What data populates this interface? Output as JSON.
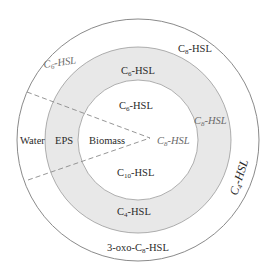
{
  "diagram": {
    "type": "concentric-layers",
    "colors": {
      "background": "#ffffff",
      "outer_ring_fill": "#ffffff",
      "eps_ring_fill": "#e8e8e8",
      "inner_fill": "#ffffff",
      "stroke": "#8a8a8a",
      "dashed": "#8a8a8a"
    },
    "regions": {
      "water": "Water",
      "eps": "EPS",
      "biomass": "Biomass"
    },
    "labels": {
      "outer_top_left": {
        "base": "C",
        "sub": "6",
        "tail": "-HSL"
      },
      "outer_top_right": {
        "base": "C",
        "sub": "8",
        "tail": "-HSL"
      },
      "outer_right": {
        "base": "C",
        "sub": "4",
        "tail": "-HSL"
      },
      "outer_bottom": {
        "pre": "3-oxo-C",
        "sub": "8",
        "tail": "-HSL"
      },
      "eps_top": {
        "base": "C",
        "sub": "6",
        "tail": "-HSL"
      },
      "eps_right": {
        "base": "C",
        "sub": "8",
        "tail": "-HSL"
      },
      "eps_bottom": {
        "base": "C",
        "sub": "4",
        "tail": "-HSL"
      },
      "inner_top": {
        "base": "C",
        "sub": "6",
        "tail": "-HSL"
      },
      "inner_right": {
        "base": "C",
        "sub": "8",
        "tail": "-HSL"
      },
      "inner_bottom": {
        "base": "C",
        "sub": "10",
        "tail": "-HSL"
      }
    }
  }
}
